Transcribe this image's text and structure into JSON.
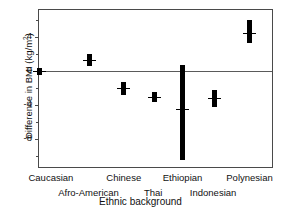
{
  "chart_data": {
    "type": "scatter",
    "title": "",
    "xlabel": "Ethnic background",
    "ylabel": "Difference in BMI (kg/m2)",
    "ylabel_prefix": "Difference in BMI (kg/m",
    "ylabel_sup": "2",
    "ylabel_suffix": ")",
    "categories": [
      "Caucasian",
      "Afro-American",
      "Chinese",
      "Thai",
      "Ethiopian",
      "Indonesian",
      "Polynesian"
    ],
    "values": [
      0.0,
      1.3,
      -2.0,
      -3.0,
      -4.5,
      -3.2,
      4.5
    ],
    "err_low": [
      -0.4,
      0.6,
      -2.8,
      -3.6,
      -10.5,
      -4.2,
      3.3
    ],
    "err_high": [
      0.4,
      2.0,
      -1.3,
      -2.5,
      0.7,
      -2.2,
      6.0
    ],
    "ylim": [
      -11.5,
      7.2
    ],
    "yticks_major": [
      4,
      0,
      -4,
      -8
    ],
    "ytick_labels": [
      "4",
      "0",
      "-4",
      "-8"
    ],
    "yticks_minor": [
      6,
      2,
      -2,
      -6,
      -10
    ],
    "grid": false,
    "legend": "none",
    "zero_reference_line": true,
    "point_x": [
      0.0,
      0.215,
      0.36,
      0.49,
      0.61,
      0.745,
      0.895
    ]
  },
  "axis": {
    "x_tick_rows": [
      {
        "row": 0,
        "labels": [
          "Caucasian",
          "Chinese",
          "Ethiopian",
          "Polynesian"
        ],
        "x": [
          0.055,
          0.365,
          0.615,
          0.9
        ]
      },
      {
        "row": 1,
        "labels": [
          "Afro-American",
          "Thai",
          "Indonesian"
        ],
        "x": [
          0.215,
          0.49,
          0.745
        ]
      }
    ]
  },
  "colors": {
    "marker": "#000000",
    "frame": "#4a4a4a",
    "zero_line": "#5a5a5a",
    "text": "#111111",
    "background": "#ffffff"
  }
}
